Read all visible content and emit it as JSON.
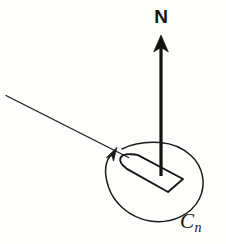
{
  "figure": {
    "kind": "line-diagram",
    "background_color": "#fdfdfb",
    "ink_color": "#1b1b1b",
    "width": 226,
    "height": 244,
    "labels": {
      "normal_vector": "N",
      "loop_symbol_base": "C",
      "loop_symbol_subscript": "n"
    },
    "elements": {
      "normal_arrow_name": "normal-vector-arrow",
      "loop_name": "oriented-loop-ellipse",
      "loop_direction_name": "loop-orientation-arrowhead",
      "surface_patch_name": "surface-patch-quadrilateral",
      "tangent_line_name": "tangent-line"
    },
    "geometry": {
      "normal_arrow": {
        "x": 161,
        "tip_y": 36,
        "base_y": 176
      },
      "ellipse": {
        "cx": 154,
        "cy": 182,
        "rx": 48,
        "ry": 40
      },
      "tangent_line": {
        "x1": 6,
        "y1": 96,
        "x2": 128,
        "y2": 157
      }
    }
  }
}
